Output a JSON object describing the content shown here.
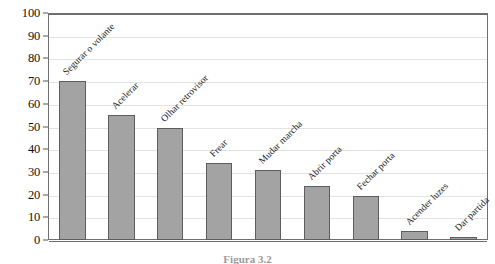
{
  "chart_data": {
    "type": "bar",
    "title": "",
    "xlabel": "",
    "ylabel": "",
    "ylim": [
      0,
      100
    ],
    "ytick_step": 10,
    "grid": true,
    "legend": "none",
    "orientation": "vertical",
    "label_rotation": -45,
    "bar_color": "#a3a3a3",
    "bar_border_color": "#5d5d5d",
    "grid_color": "#e3e3e3",
    "frame_color": "#6f6f6f",
    "categories": [
      "Segurar o volante",
      "Acelerar",
      "Olhar retrovisor",
      "Frear",
      "Mudar marcha",
      "Abrir porta",
      "Fechar porta",
      "Acender luzes",
      "Dar partida"
    ],
    "values": [
      70,
      55,
      49.5,
      34,
      31,
      24,
      19.5,
      4,
      1.5
    ],
    "ytick_labels": [
      "0",
      "10",
      "20",
      "30",
      "40",
      "50",
      "60",
      "70",
      "80",
      "90",
      "100"
    ]
  },
  "caption": {
    "text": "Figura 3.2"
  }
}
